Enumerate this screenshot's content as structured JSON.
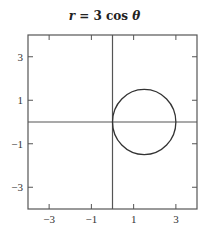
{
  "chart_data": {
    "type": "line",
    "title": "r = 3 cos θ",
    "title_parts": {
      "var": "r",
      "eq": " = 3 cos ",
      "theta": "θ"
    },
    "xlabel": "",
    "ylabel": "",
    "xlim": [
      -4,
      4
    ],
    "ylim": [
      -4,
      4
    ],
    "xticks": [
      -3,
      -1,
      1,
      3
    ],
    "yticks": [
      3,
      1,
      -1,
      -3
    ],
    "xtick_labels": [
      "−3",
      "−1",
      "1",
      "3"
    ],
    "ytick_labels": [
      "3",
      "1",
      "−1",
      "−3"
    ],
    "grid": false,
    "axes_through_origin": true,
    "series": [
      {
        "name": "r = 3cos θ",
        "shape": "circle",
        "center": [
          1.5,
          0
        ],
        "radius": 1.5,
        "color": "#333333"
      }
    ]
  }
}
